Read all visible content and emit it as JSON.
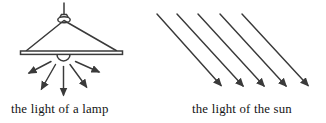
{
  "colors": {
    "background": "#ffffff",
    "line": "#3a3a3a",
    "text": "#141414"
  },
  "lamp_diagram": {
    "label": "the light of a lamp",
    "ray_count": 5,
    "ray_style": "diverging downward from bulb",
    "rays": [
      {
        "x1": 51,
        "y1": 61.5,
        "x2": 29,
        "y2": 73
      },
      {
        "x1": 55.5,
        "y1": 64.5,
        "x2": 41.5,
        "y2": 89
      },
      {
        "x1": 63.5,
        "y1": 66.5,
        "x2": 63.5,
        "y2": 95
      },
      {
        "x1": 70,
        "y1": 64.5,
        "x2": 86.5,
        "y2": 87
      },
      {
        "x1": 75.5,
        "y1": 61.5,
        "x2": 99,
        "y2": 72
      }
    ]
  },
  "sun_diagram": {
    "label": "the light of the sun",
    "ray_count": 5,
    "ray_style": "parallel, slanting down-right",
    "rays": [
      {
        "x1": 157,
        "y1": 14,
        "x2": 221,
        "y2": 85.5
      },
      {
        "x1": 177,
        "y1": 14,
        "x2": 243,
        "y2": 86
      },
      {
        "x1": 198,
        "y1": 14,
        "x2": 264,
        "y2": 86
      },
      {
        "x1": 220,
        "y1": 14,
        "x2": 286,
        "y2": 86
      },
      {
        "x1": 242,
        "y1": 14,
        "x2": 308,
        "y2": 85.5
      }
    ]
  }
}
